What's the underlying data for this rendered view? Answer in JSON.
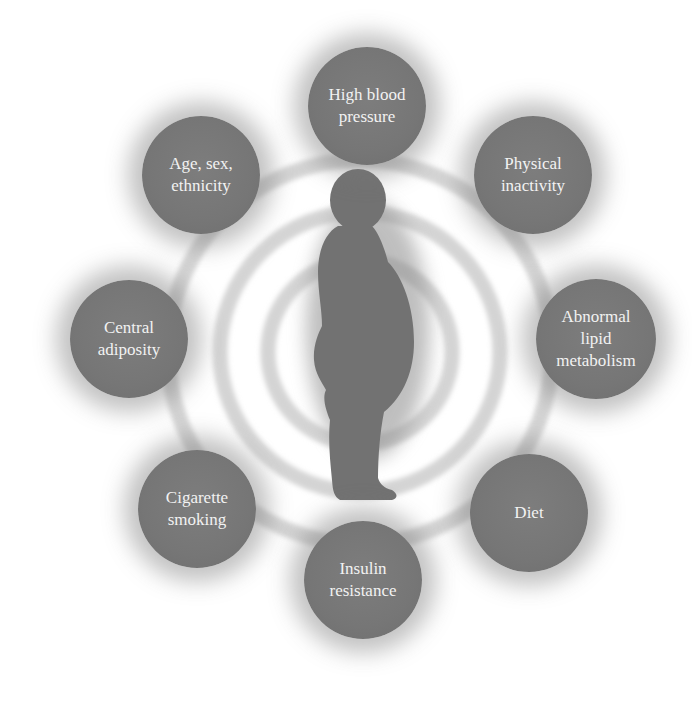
{
  "diagram": {
    "center_figure": "obese-person-silhouette",
    "colors": {
      "background": "#ffffff",
      "circle_fill": "#777777",
      "circle_text": "#f2f2f2",
      "ring": "#d6d6d6",
      "figure": "#6f6f6f"
    },
    "factors": [
      {
        "lines": [
          "High blood",
          "pressure"
        ]
      },
      {
        "lines": [
          "Physical",
          "inactivity"
        ]
      },
      {
        "lines": [
          "Abnormal",
          "lipid",
          "metabolism"
        ]
      },
      {
        "lines": [
          "Diet"
        ]
      },
      {
        "lines": [
          "Insulin",
          "resistance"
        ]
      },
      {
        "lines": [
          "Cigarette",
          "smoking"
        ]
      },
      {
        "lines": [
          "Central",
          "adiposity"
        ]
      },
      {
        "lines": [
          "Age, sex,",
          "ethnicity"
        ]
      }
    ]
  }
}
